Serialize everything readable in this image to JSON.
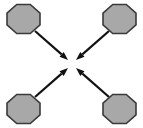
{
  "canvas": {
    "width": 143,
    "height": 128,
    "background_color": "#FFFFFF",
    "title": "Four nodes converging to a center point"
  },
  "style": {
    "node_fill_color": "#A8A8A8",
    "node_stroke_color": "#3A3A3A",
    "node_stroke_width": 1.6,
    "arrow_color": "#111111",
    "arrow_stroke_width": 2.2
  },
  "chart_data": {
    "type": "diagram",
    "subtype": "convergence",
    "center_point": {
      "x": 72,
      "y": 64
    },
    "node_shape": "octagon",
    "node_count": 4,
    "arrow_count": 4,
    "nodes": [
      {
        "id": "node-top-left",
        "position": "top-left",
        "label": "",
        "cx": 23.5,
        "cy": 19,
        "width": 33,
        "height": 29,
        "fill": "#A8A8A8",
        "stroke": "#3A3A3A"
      },
      {
        "id": "node-top-right",
        "position": "top-right",
        "label": "",
        "cx": 119.5,
        "cy": 19,
        "width": 33,
        "height": 29,
        "fill": "#A8A8A8",
        "stroke": "#3A3A3A"
      },
      {
        "id": "node-bottom-left",
        "position": "bottom-left",
        "label": "",
        "cx": 23.5,
        "cy": 109,
        "width": 33,
        "height": 29,
        "fill": "#A8A8A8",
        "stroke": "#3A3A3A"
      },
      {
        "id": "node-bottom-right",
        "position": "bottom-right",
        "label": "",
        "cx": 119.5,
        "cy": 109,
        "width": 33,
        "height": 29,
        "fill": "#A8A8A8",
        "stroke": "#3A3A3A"
      }
    ],
    "arrows": [
      {
        "id": "arrow-top-left-to-center",
        "from": "node-top-left",
        "to": "center",
        "label": "",
        "x1": 35,
        "y1": 31,
        "x2": 68,
        "y2": 60,
        "color": "#111111"
      },
      {
        "id": "arrow-top-right-to-center",
        "from": "node-top-right",
        "to": "center",
        "label": "",
        "x1": 109,
        "y1": 31,
        "x2": 76,
        "y2": 60,
        "color": "#111111"
      },
      {
        "id": "arrow-bottom-left-to-center",
        "from": "node-bottom-left",
        "to": "center",
        "label": "",
        "x1": 35,
        "y1": 97,
        "x2": 68,
        "y2": 68,
        "color": "#111111"
      },
      {
        "id": "arrow-bottom-right-to-center",
        "from": "node-bottom-right",
        "to": "center",
        "label": "",
        "x1": 109,
        "y1": 97,
        "x2": 76,
        "y2": 68,
        "color": "#111111"
      }
    ]
  }
}
